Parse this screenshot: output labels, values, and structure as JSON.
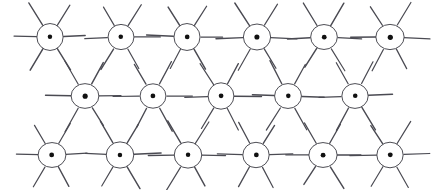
{
  "figure": {
    "canvas": {
      "width": 439,
      "height": 190,
      "background_color": "#ffffff"
    },
    "style": {
      "stroke_color": "#3a3a42",
      "ray_color": "#4a4a52",
      "dot_color": "#111111",
      "circle_stroke_width": 0.9,
      "ray_stroke_width": 1.15,
      "circle_radius": 13.5,
      "dot_radius": 2.4,
      "ray_inner_gap": 0,
      "ray_length": 24
    },
    "symbol": {
      "name": "radiating-circle-symbol",
      "ray_count": 6,
      "ray_angles_deg": [
        0,
        60,
        120,
        180,
        240,
        300
      ],
      "parts": [
        "outer-circle",
        "center-dot",
        "six-rays"
      ]
    },
    "rows": [
      {
        "row_index": 0,
        "label": "top-row",
        "center_y": 37,
        "count": 6,
        "centers_x": [
          50,
          121,
          187,
          257,
          324,
          390
        ]
      },
      {
        "row_index": 1,
        "label": "middle-row",
        "center_y": 96,
        "count": 5,
        "centers_x": [
          85,
          153,
          221,
          288,
          355
        ]
      },
      {
        "row_index": 2,
        "label": "bottom-row",
        "center_y": 155,
        "count": 6,
        "centers_x": [
          52,
          120,
          188,
          256,
          323,
          390
        ]
      }
    ],
    "total_symbols": 17
  }
}
